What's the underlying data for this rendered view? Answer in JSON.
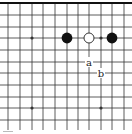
{
  "diagram": {
    "type": "go-board-fragment",
    "edge": "top",
    "grid": {
      "x_lines": [
        8,
        20,
        32,
        43,
        55,
        67,
        78,
        89,
        101,
        112,
        124
      ],
      "y_lines": [
        3,
        15,
        27,
        38,
        50,
        62,
        73,
        85,
        97,
        108,
        120
      ],
      "extends_bottom_to": 130,
      "extends_left_from": 0,
      "extends_right_to": 132
    },
    "colors": {
      "line": "#333333",
      "edge_line": "#111111",
      "black_stone": "#111111",
      "white_stone_fill": "#ffffff",
      "white_stone_stroke": "#222222",
      "label": "#222222"
    },
    "star_points": [
      {
        "col": 2,
        "row": 3
      },
      {
        "col": 8,
        "row": 3
      },
      {
        "col": 2,
        "row": 9
      },
      {
        "col": 8,
        "row": 9
      }
    ],
    "stones": [
      {
        "color": "black",
        "col": 5,
        "row": 3
      },
      {
        "color": "white",
        "col": 7,
        "row": 3
      },
      {
        "color": "black",
        "col": 9,
        "row": 3
      }
    ],
    "labels": [
      {
        "text": "a",
        "col": 7,
        "row": 5
      },
      {
        "text": "b",
        "col": 8,
        "row": 6
      }
    ]
  }
}
